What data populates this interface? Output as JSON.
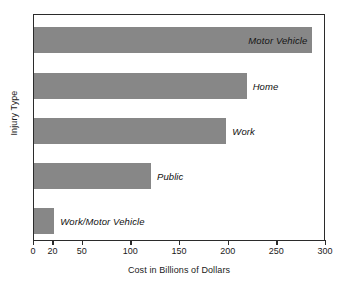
{
  "chart_data": {
    "type": "bar",
    "orientation": "horizontal",
    "title": "",
    "xlabel": "Cost in Billions of Dollars",
    "ylabel": "Injury Type",
    "categories": [
      "Motor Vehicle",
      "Home",
      "Work",
      "Public",
      "Work/Motor Vehicle"
    ],
    "values": [
      288,
      220,
      199,
      121,
      21
    ],
    "xlim": [
      0,
      300
    ],
    "xticks": [
      0,
      20,
      50,
      100,
      150,
      200,
      250,
      300
    ],
    "xticklabels": [
      "0",
      "20",
      "50",
      "100",
      "150",
      "200",
      "250",
      "300"
    ],
    "grid": false,
    "legend": false,
    "bar_color": "#878787",
    "frame_color": "#2b2b2b",
    "label_style": "italic",
    "bars": [
      {
        "category": "Motor Vehicle",
        "value": 288,
        "label": "Motor Vehicle",
        "label_position": "inside"
      },
      {
        "category": "Home",
        "value": 220,
        "label": "Home",
        "label_position": "outside"
      },
      {
        "category": "Work",
        "value": 199,
        "label": "Work",
        "label_position": "outside"
      },
      {
        "category": "Public",
        "value": 121,
        "label": "Public",
        "label_position": "outside"
      },
      {
        "category": "Work/Motor Vehicle",
        "value": 21,
        "label": "Work/Motor Vehicle",
        "label_position": "outside"
      }
    ]
  }
}
